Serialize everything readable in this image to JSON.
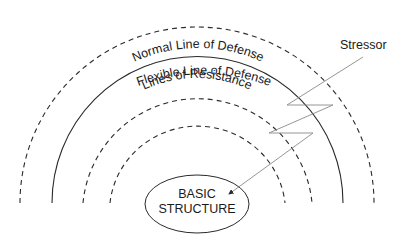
{
  "diagram": {
    "rings": [
      {
        "id": "flexible",
        "label": "Flexible Line of Defense",
        "style": "dashed",
        "radius": 177
      },
      {
        "id": "normal",
        "label": "Normal Line of Defense",
        "style": "solid",
        "radius": 145
      },
      {
        "id": "resistance",
        "label": "Lines of Resistance",
        "style": "dashed",
        "radius": 115
      },
      {
        "id": "resistance-inner",
        "label": "",
        "style": "dashed",
        "radius": 88
      }
    ],
    "core": {
      "line1": "BASIC",
      "line2": "STRUCTURE"
    },
    "stressor": {
      "label": "Stressor"
    },
    "colors": {
      "line": "#2a2a2a",
      "stressor": "#8a8a8a"
    }
  }
}
